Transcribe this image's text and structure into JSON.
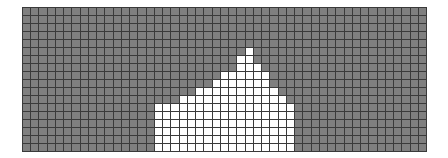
{
  "grid": {
    "columns": 49,
    "rows": 18,
    "colors": {
      "background": "#7f7f7f",
      "fill": "#ffffff",
      "lines": "#3a3a3a"
    },
    "filled_column_heights": {
      "16": 6,
      "17": 6,
      "18": 6,
      "19": 7,
      "20": 7,
      "21": 8,
      "22": 8,
      "23": 9,
      "24": 10,
      "25": 10,
      "26": 12,
      "27": 13,
      "28": 11,
      "29": 10,
      "30": 8,
      "31": 7,
      "32": 6
    }
  }
}
